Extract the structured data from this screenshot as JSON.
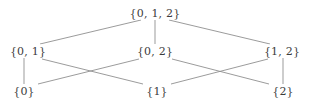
{
  "figure": {
    "kind": "hasse-diagram",
    "title": "",
    "background_color": "#ffffff",
    "edge_color": "#909090",
    "text_color": "#3c3c3c",
    "width": 311,
    "height": 108
  },
  "chart_data": {
    "type": "diagram",
    "title": "",
    "xlabel": "",
    "ylabel": "",
    "grid": false,
    "legend": false,
    "levels": [
      {
        "rank": 2,
        "y": 13,
        "nodes": [
          "n012"
        ]
      },
      {
        "rank": 1,
        "y": 51,
        "nodes": [
          "n01",
          "n02",
          "n12"
        ]
      },
      {
        "rank": 0,
        "y": 91,
        "nodes": [
          "n0",
          "n1",
          "n2"
        ]
      }
    ],
    "nodes": [
      {
        "id": "n012",
        "label": "{0, 1, 2}",
        "x": 155,
        "y": 13,
        "rank": 2
      },
      {
        "id": "n01",
        "label": "{0, 1}",
        "x": 28,
        "y": 51,
        "rank": 1
      },
      {
        "id": "n02",
        "label": "{0, 2}",
        "x": 155,
        "y": 51,
        "rank": 1
      },
      {
        "id": "n12",
        "label": "{1, 2}",
        "x": 282,
        "y": 51,
        "rank": 1
      },
      {
        "id": "n0",
        "label": "{0}",
        "x": 24,
        "y": 91,
        "rank": 0
      },
      {
        "id": "n1",
        "label": "{1}",
        "x": 157,
        "y": 91,
        "rank": 0
      },
      {
        "id": "n2",
        "label": "{2}",
        "x": 283,
        "y": 91,
        "rank": 0
      }
    ],
    "edges": [
      {
        "from": "n01",
        "to": "n012",
        "x1": 40,
        "y1": 44,
        "x2": 141,
        "y2": 20
      },
      {
        "from": "n02",
        "to": "n012",
        "x1": 155,
        "y1": 44,
        "x2": 155,
        "y2": 20
      },
      {
        "from": "n12",
        "to": "n012",
        "x1": 270,
        "y1": 44,
        "x2": 169,
        "y2": 20
      },
      {
        "from": "n0",
        "to": "n01",
        "x1": 24,
        "y1": 84,
        "x2": 24,
        "y2": 58
      },
      {
        "from": "n0",
        "to": "n02",
        "x1": 38,
        "y1": 84,
        "x2": 139,
        "y2": 59
      },
      {
        "from": "n1",
        "to": "n01",
        "x1": 143,
        "y1": 84,
        "x2": 42,
        "y2": 59
      },
      {
        "from": "n1",
        "to": "n12",
        "x1": 171,
        "y1": 84,
        "x2": 268,
        "y2": 59
      },
      {
        "from": "n2",
        "to": "n02",
        "x1": 269,
        "y1": 84,
        "x2": 172,
        "y2": 59
      },
      {
        "from": "n2",
        "to": "n12",
        "x1": 283,
        "y1": 84,
        "x2": 283,
        "y2": 58
      }
    ]
  }
}
